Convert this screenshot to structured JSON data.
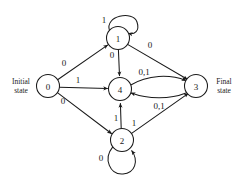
{
  "figure": {
    "type": "state-transition-diagram",
    "initial_state_label": "Initial\nstate",
    "final_state_label": "Final\nstate"
  },
  "nodes": [
    {
      "id": "0",
      "label": "0",
      "cx": 48,
      "cy": 86,
      "r": 11.5,
      "role": "initial"
    },
    {
      "id": "1",
      "label": "1",
      "cx": 118,
      "cy": 38,
      "r": 11.5,
      "role": "state"
    },
    {
      "id": "4",
      "label": "4",
      "cx": 120,
      "cy": 89,
      "r": 11.5,
      "role": "state"
    },
    {
      "id": "2",
      "label": "2",
      "cx": 122,
      "cy": 140,
      "r": 11.5,
      "role": "state"
    },
    {
      "id": "3",
      "label": "3",
      "cx": 196,
      "cy": 86,
      "r": 11.5,
      "role": "final"
    }
  ],
  "edges": [
    {
      "from": "0",
      "to": "1",
      "label": "0",
      "label_x": 64,
      "label_y": 63
    },
    {
      "from": "0",
      "to": "4",
      "label": "1",
      "label_x": 78,
      "label_y": 80
    },
    {
      "from": "0",
      "to": "2",
      "label": "0",
      "label_x": 63,
      "label_y": 101
    },
    {
      "from": "1",
      "to": "1",
      "label": "1",
      "label_x": 104,
      "label_y": 20,
      "self_loop": true
    },
    {
      "from": "1",
      "to": "4",
      "label": "0",
      "label_x": 112,
      "label_y": 55
    },
    {
      "from": "1",
      "to": "3",
      "label": "0",
      "label_x": 150,
      "label_y": 45
    },
    {
      "from": "4",
      "to": "3",
      "label": "0,1",
      "label_x": 144,
      "label_y": 72
    },
    {
      "from": "3",
      "to": "4",
      "label": "0,1",
      "label_x": 159,
      "label_y": 106
    },
    {
      "from": "2",
      "to": "2",
      "label": "0",
      "label_x": 101,
      "label_y": 158,
      "self_loop": true
    },
    {
      "from": "2",
      "to": "4",
      "label": "1",
      "label_x": 116,
      "label_y": 118
    },
    {
      "from": "2",
      "to": "3",
      "label": "1",
      "label_x": 134,
      "label_y": 123
    }
  ],
  "colors": {
    "ink": "#1a1a1a",
    "paper": "#ffffff"
  }
}
